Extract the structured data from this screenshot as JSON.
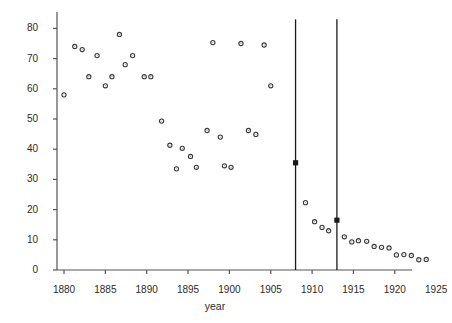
{
  "chart_data": {
    "type": "scatter",
    "title": "",
    "xlabel": "year",
    "ylabel": "typhoid rate: deaths per 100,000 persons",
    "xlim": [
      1879,
      1926.5
    ],
    "ylim": [
      0,
      83
    ],
    "xticks": [
      1880,
      1885,
      1890,
      1895,
      1900,
      1905,
      1910,
      1915,
      1920,
      1925
    ],
    "yticks": [
      0,
      10,
      20,
      30,
      40,
      50,
      60,
      70,
      80
    ],
    "grid": false,
    "legend": null,
    "marker": "open-circle",
    "x": [
      1880,
      1881,
      1882,
      1883,
      1884,
      1885,
      1886,
      1887,
      1888,
      1889,
      1890,
      1891,
      1892,
      1893,
      1894,
      1895,
      1896,
      1897,
      1898,
      1899,
      1900,
      1901,
      1902,
      1903,
      1904,
      1905,
      1906,
      1907,
      1908,
      1909,
      1910,
      1911,
      1912,
      1913,
      1914,
      1915,
      1916,
      1917,
      1918,
      1919,
      1920,
      1921,
      1922,
      1923,
      1924,
      1925
    ],
    "y": [
      58.0,
      74.0,
      73.0,
      64.0,
      71.0,
      61.0,
      64.0,
      78.0,
      68.0,
      71.0,
      64.0,
      64.0,
      49.3,
      41.3,
      33.5,
      40.3,
      37.6,
      34.0,
      34.2,
      75.3,
      46.2,
      44.0,
      34.5,
      34.0,
      75.0,
      61.0,
      35.5,
      22.3,
      16.0,
      14.1,
      13.0,
      16.5,
      11.0,
      9.3,
      9.7,
      9.5,
      7.8,
      7.5,
      7.3,
      6.2,
      5.0,
      5.1,
      4.8,
      3.4,
      3.5,
      3.4
    ],
    "vertical_lines": [
      {
        "x": 1908,
        "y_top": 83,
        "y_bottom": 0,
        "marker_y": 35.5
      },
      {
        "x": 1913,
        "y_top": 83,
        "y_bottom": 0,
        "marker_y": 16.5
      }
    ],
    "series_points": [
      {
        "x": 1880,
        "y": 58.0
      },
      {
        "x": 1881.3,
        "y": 74.0
      },
      {
        "x": 1882.2,
        "y": 73.0
      },
      {
        "x": 1883.0,
        "y": 64.0
      },
      {
        "x": 1884.0,
        "y": 71.0
      },
      {
        "x": 1885.0,
        "y": 61.0
      },
      {
        "x": 1885.8,
        "y": 64.0
      },
      {
        "x": 1886.7,
        "y": 78.0
      },
      {
        "x": 1887.4,
        "y": 68.0
      },
      {
        "x": 1888.3,
        "y": 71.0
      },
      {
        "x": 1889.7,
        "y": 64.0
      },
      {
        "x": 1890.5,
        "y": 64.0
      },
      {
        "x": 1891.8,
        "y": 49.3
      },
      {
        "x": 1892.8,
        "y": 41.3
      },
      {
        "x": 1893.6,
        "y": 33.5
      },
      {
        "x": 1894.3,
        "y": 40.3
      },
      {
        "x": 1895.3,
        "y": 37.6
      },
      {
        "x": 1896.0,
        "y": 34.0
      },
      {
        "x": 1897.3,
        "y": 46.2
      },
      {
        "x": 1898.0,
        "y": 75.3
      },
      {
        "x": 1898.9,
        "y": 44.0
      },
      {
        "x": 1899.4,
        "y": 34.5
      },
      {
        "x": 1900.2,
        "y": 34.0
      },
      {
        "x": 1901.4,
        "y": 75.0
      },
      {
        "x": 1902.3,
        "y": 46.2
      },
      {
        "x": 1903.2,
        "y": 44.9
      },
      {
        "x": 1904.2,
        "y": 74.5
      },
      {
        "x": 1905.0,
        "y": 61.0
      },
      {
        "x": 1909.2,
        "y": 22.3
      },
      {
        "x": 1910.3,
        "y": 16.0
      },
      {
        "x": 1911.2,
        "y": 14.1
      },
      {
        "x": 1912.0,
        "y": 13.0
      },
      {
        "x": 1913.9,
        "y": 11.0
      },
      {
        "x": 1914.8,
        "y": 9.3
      },
      {
        "x": 1915.6,
        "y": 9.7
      },
      {
        "x": 1916.6,
        "y": 9.5
      },
      {
        "x": 1917.5,
        "y": 7.8
      },
      {
        "x": 1918.4,
        "y": 7.5
      },
      {
        "x": 1919.3,
        "y": 7.3
      },
      {
        "x": 1920.2,
        "y": 5.0
      },
      {
        "x": 1921.1,
        "y": 5.1
      },
      {
        "x": 1922.0,
        "y": 4.8
      },
      {
        "x": 1922.9,
        "y": 3.4
      },
      {
        "x": 1923.8,
        "y": 3.5
      },
      {
        "x": 1924.9,
        "y": 3.4
      }
    ],
    "axis_color": "#555555",
    "marker_color": "#3a3a3a",
    "line_color": "#1a1a1a"
  },
  "axes": {
    "xlabel": "year",
    "ylabel": "typhoid rate: deaths per 100,000 persons",
    "xtick_labels": [
      "1880",
      "1885",
      "1890",
      "1895",
      "1900",
      "1905",
      "1910",
      "1915",
      "1920",
      "1925"
    ],
    "ytick_labels": [
      "0",
      "10",
      "20",
      "30",
      "40",
      "50",
      "60",
      "70",
      "80"
    ]
  }
}
